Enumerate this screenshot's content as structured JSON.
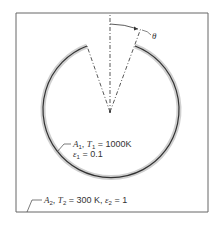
{
  "diagram": {
    "title": "",
    "angle_label": "θ",
    "surface1": {
      "line1": {
        "area": "A",
        "area_sub": "1",
        "temp": "T",
        "temp_sub": "1",
        "temp_value": " = 1000K"
      },
      "line2": {
        "emiss": "ε",
        "emiss_sub": "1",
        "emiss_value": " = 0.1"
      }
    },
    "surface2": {
      "area": "A",
      "area_sub": "2",
      "temp": "T",
      "temp_sub": "2",
      "temp_value": " = 300 K, ",
      "emiss": "ε",
      "emiss_sub": "2",
      "emiss_value": " = 1"
    },
    "colors": {
      "line": "#333333",
      "shadow": "#c8c8c8",
      "frame": "#555555"
    }
  }
}
